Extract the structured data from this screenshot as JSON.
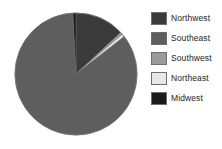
{
  "chart_data": {
    "type": "pie",
    "title": "",
    "categories": [
      "Northwest",
      "Southeast",
      "Southwest",
      "Northeast",
      "Midwest"
    ],
    "values": [
      13.1,
      84.7,
      0.6,
      0.8,
      0.8
    ],
    "units": "percent",
    "start_angle_deg": 0,
    "direction": "clockwise",
    "colors": [
      "#3a3a3a",
      "#5e5e5e",
      "#9a9a9a",
      "#e8e8e8",
      "#1a1a1a"
    ],
    "legend_position": "right",
    "grid": false,
    "xlabel": "",
    "ylabel": "",
    "slices": [
      {
        "label": "Northwest",
        "value": 13.1,
        "color": "#3a3a3a",
        "start_deg": 0,
        "end_deg": 47.2
      },
      {
        "label": "Southwest",
        "value": 0.6,
        "color": "#9a9a9a",
        "start_deg": 47.2,
        "end_deg": 49.3
      },
      {
        "label": "Northeast",
        "value": 0.8,
        "color": "#e8e8e8",
        "start_deg": 49.3,
        "end_deg": 52.2
      },
      {
        "label": "Southeast",
        "value": 84.7,
        "color": "#5e5e5e",
        "start_deg": 52.2,
        "end_deg": 357.1
      },
      {
        "label": "Midwest",
        "value": 0.8,
        "color": "#1a1a1a",
        "start_deg": 357.1,
        "end_deg": 360
      }
    ]
  },
  "legend": {
    "items": [
      {
        "label": "Northwest",
        "color": "#3a3a3a"
      },
      {
        "label": "Southeast",
        "color": "#5e5e5e"
      },
      {
        "label": "Southwest",
        "color": "#9a9a9a"
      },
      {
        "label": "Northeast",
        "color": "#e8e8e8"
      },
      {
        "label": "Midwest",
        "color": "#1a1a1a"
      }
    ]
  },
  "geometry": {
    "center_x": 76,
    "center_y": 74,
    "radius": 61,
    "outline_color": "#6e6e6e"
  }
}
